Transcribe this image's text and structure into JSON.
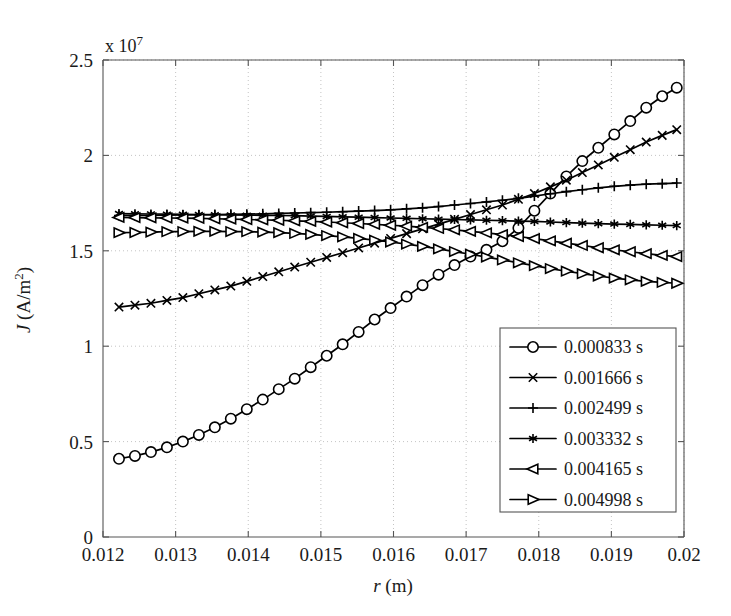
{
  "chart_data": {
    "type": "line",
    "title": "",
    "xlabel": "r (m)",
    "ylabel": "J (A/m2)",
    "ylabel_parts": {
      "symbol": "J",
      "units_pre": " (A/m",
      "units_exp": "2",
      "units_post": ")"
    },
    "xlabel_parts": {
      "symbol": "r",
      "units": " (m)"
    },
    "y_exponent_label": "x 10",
    "y_exponent_power": "7",
    "y_scale": 10000000,
    "xlim": [
      0.012,
      0.02
    ],
    "ylim": [
      0,
      25000000
    ],
    "xticks": [
      0.012,
      0.013,
      0.014,
      0.015,
      0.016,
      0.017,
      0.018,
      0.019,
      0.02
    ],
    "xtick_labels": [
      "0.012",
      "0.013",
      "0.014",
      "0.015",
      "0.016",
      "0.017",
      "0.018",
      "0.019",
      "0.02"
    ],
    "yticks": [
      0,
      5000000,
      10000000,
      15000000,
      20000000,
      25000000
    ],
    "ytick_labels": [
      "0",
      "0.5",
      "1",
      "1.5",
      "2",
      "2.5"
    ],
    "grid": true,
    "grid_style": "dotted",
    "legend_position": "lower-right",
    "x": [
      0.01222,
      0.01244,
      0.01266,
      0.01288,
      0.0131,
      0.01332,
      0.01354,
      0.01376,
      0.01398,
      0.0142,
      0.01442,
      0.01464,
      0.01486,
      0.01508,
      0.0153,
      0.01552,
      0.01574,
      0.01596,
      0.01618,
      0.0164,
      0.01662,
      0.01684,
      0.01706,
      0.01728,
      0.0175,
      0.01772,
      0.01794,
      0.01816,
      0.01838,
      0.0186,
      0.01882,
      0.01904,
      0.01926,
      0.01948,
      0.0197,
      0.0199
    ],
    "series": [
      {
        "name": "0.000833 s",
        "label": "0.000833 s",
        "marker": "circle",
        "marker_style": "open",
        "values": [
          4100000,
          4250000,
          4450000,
          4700000,
          5000000,
          5350000,
          5750000,
          6200000,
          6700000,
          7200000,
          7750000,
          8300000,
          8900000,
          9500000,
          10100000,
          10750000,
          11400000,
          12000000,
          12600000,
          13200000,
          13750000,
          14250000,
          14700000,
          15050000,
          15500000,
          16200000,
          17100000,
          18000000,
          18900000,
          19700000,
          20400000,
          21100000,
          21800000,
          22500000,
          23100000,
          23550000
        ]
      },
      {
        "name": "0.001666 s",
        "label": "0.001666 s",
        "marker": "x",
        "marker_style": "solid",
        "values": [
          12050000,
          12150000,
          12250000,
          12400000,
          12550000,
          12750000,
          12950000,
          13150000,
          13400000,
          13650000,
          13900000,
          14150000,
          14400000,
          14650000,
          14900000,
          15150000,
          15400000,
          15650000,
          15900000,
          16150000,
          16400000,
          16650000,
          16900000,
          17150000,
          17400000,
          17700000,
          18000000,
          18350000,
          18700000,
          19100000,
          19500000,
          19900000,
          20300000,
          20700000,
          21050000,
          21350000
        ]
      },
      {
        "name": "0.002499 s",
        "label": "0.002499 s",
        "marker": "plus",
        "marker_style": "solid",
        "values": [
          16850000,
          16850000,
          16850000,
          16870000,
          16880000,
          16890000,
          16900000,
          16910000,
          16920000,
          16940000,
          16960000,
          16980000,
          17000000,
          17020000,
          17050000,
          17080000,
          17110000,
          17150000,
          17200000,
          17250000,
          17320000,
          17400000,
          17480000,
          17560000,
          17650000,
          17750000,
          17870000,
          17990000,
          18100000,
          18200000,
          18300000,
          18380000,
          18440000,
          18490000,
          18520000,
          18550000
        ]
      },
      {
        "name": "0.003332 s",
        "label": "0.003332 s",
        "marker": "asterisk",
        "marker_style": "solid",
        "values": [
          16950000,
          16940000,
          16930000,
          16920000,
          16910000,
          16900000,
          16890000,
          16880000,
          16870000,
          16860000,
          16850000,
          16840000,
          16820000,
          16800000,
          16780000,
          16760000,
          16740000,
          16720000,
          16700000,
          16680000,
          16660000,
          16640000,
          16620000,
          16600000,
          16580000,
          16560000,
          16540000,
          16510000,
          16480000,
          16450000,
          16420000,
          16400000,
          16380000,
          16360000,
          16340000,
          16320000
        ]
      },
      {
        "name": "0.004165 s",
        "label": "0.004165 s",
        "marker": "triangle-left",
        "marker_style": "open",
        "values": [
          16750000,
          16740000,
          16730000,
          16720000,
          16710000,
          16700000,
          16680000,
          16660000,
          16640000,
          16620000,
          16600000,
          16570000,
          16540000,
          16510000,
          16470000,
          16430000,
          16390000,
          16340000,
          16290000,
          16230000,
          16170000,
          16100000,
          16020000,
          15940000,
          15850000,
          15750000,
          15640000,
          15520000,
          15400000,
          15280000,
          15160000,
          15050000,
          14950000,
          14850000,
          14760000,
          14700000
        ]
      },
      {
        "name": "0.004998 s",
        "label": "0.004998 s",
        "marker": "triangle-right",
        "marker_style": "open",
        "values": [
          15950000,
          15960000,
          15980000,
          16000000,
          16010000,
          16020000,
          16020000,
          16010000,
          16000000,
          15980000,
          15950000,
          15910000,
          15860000,
          15800000,
          15730000,
          15650000,
          15560000,
          15460000,
          15350000,
          15230000,
          15100000,
          14960000,
          14820000,
          14670000,
          14520000,
          14370000,
          14220000,
          14070000,
          13930000,
          13800000,
          13680000,
          13570000,
          13480000,
          13400000,
          13340000,
          13300000
        ]
      }
    ]
  },
  "colors": {
    "line": "#000000",
    "axis": "#555555",
    "grid": "#bdbdbd",
    "background": "#ffffff",
    "text": "#1a1a1a"
  }
}
